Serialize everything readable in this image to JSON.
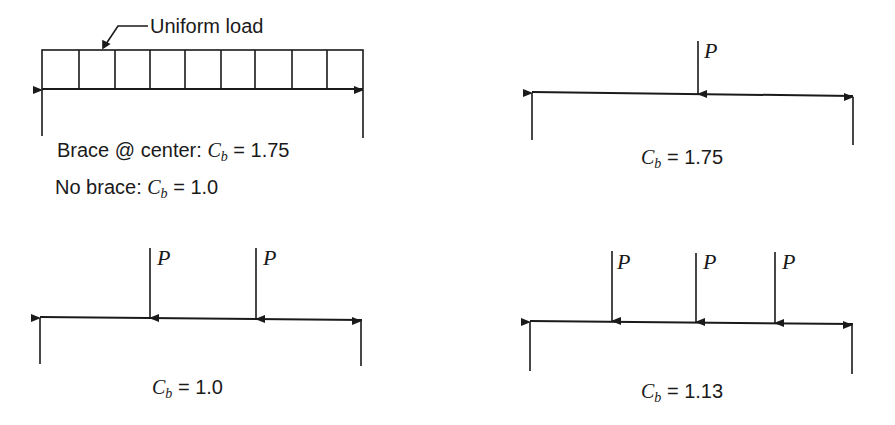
{
  "diagram": {
    "type": "beam-loading-cases",
    "panels": [
      {
        "id": "uniform",
        "load_type": "uniform",
        "load_label": "Uniform load",
        "cells": 9,
        "captions": [
          {
            "prefix": "Brace @ center: ",
            "symbol": "C",
            "sub": "b",
            "eq": " = ",
            "value": "1.75"
          },
          {
            "prefix": "No brace: ",
            "symbol": "C",
            "sub": "b",
            "eq": " = ",
            "value": "1.0"
          }
        ]
      },
      {
        "id": "single-point",
        "load_type": "point",
        "loads": [
          "P"
        ],
        "captions": [
          {
            "prefix": "",
            "symbol": "C",
            "sub": "b",
            "eq": " = ",
            "value": "1.75"
          }
        ]
      },
      {
        "id": "two-point",
        "load_type": "point",
        "loads": [
          "P",
          "P"
        ],
        "captions": [
          {
            "prefix": "",
            "symbol": "C",
            "sub": "b",
            "eq": " = ",
            "value": "1.0"
          }
        ]
      },
      {
        "id": "three-point",
        "load_type": "point",
        "loads": [
          "P",
          "P",
          "P"
        ],
        "captions": [
          {
            "prefix": "",
            "symbol": "C",
            "sub": "b",
            "eq": " = ",
            "value": "1.13"
          }
        ]
      }
    ]
  }
}
